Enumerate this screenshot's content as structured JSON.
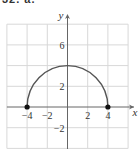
{
  "header": {
    "label": "32. a."
  },
  "chart_data": {
    "type": "line",
    "title": "",
    "xlabel": "x",
    "ylabel": "y",
    "xlim": [
      -6,
      6
    ],
    "ylim": [
      -4,
      8
    ],
    "grid": true,
    "grid_step": 2,
    "x_ticks": [
      {
        "value": -4,
        "label": "−4"
      },
      {
        "value": -2,
        "label": "−2"
      },
      {
        "value": 2,
        "label": "2"
      },
      {
        "value": 4,
        "label": "4"
      }
    ],
    "y_ticks": [
      {
        "value": 6,
        "label": "6"
      },
      {
        "value": 2,
        "label": "2"
      },
      {
        "value": -2,
        "label": "−2"
      }
    ],
    "series": [
      {
        "name": "upper semicircle y = sqrt(16 - x^2)",
        "shape": "semicircle",
        "center": [
          0,
          0
        ],
        "radius": 4,
        "x": [
          -4,
          -3,
          -2,
          -1,
          0,
          1,
          2,
          3,
          4
        ],
        "y": [
          0,
          2.65,
          3.46,
          3.87,
          4,
          3.87,
          3.46,
          2.65,
          0
        ],
        "color": "#555555"
      }
    ],
    "points": [
      {
        "x": -4,
        "y": 0,
        "style": "filled"
      },
      {
        "x": 4,
        "y": 0,
        "style": "filled"
      }
    ],
    "colors": {
      "grid": "#d8d8d8",
      "axis": "#666666",
      "curve": "#555555",
      "point": "#111111"
    }
  }
}
